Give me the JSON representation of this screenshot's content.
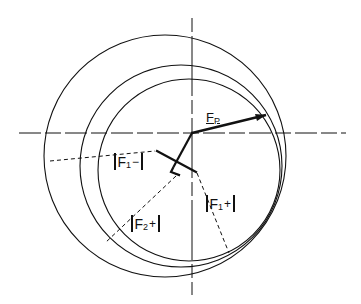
{
  "diagram": {
    "type": "harker-construction",
    "colors": {
      "ink": "#111111",
      "background": "#ffffff"
    },
    "axes": {
      "origin": [
        192,
        133
      ],
      "horizontal": {
        "y": 133,
        "x_from": 19,
        "x_to": 346,
        "style": "dash-dot"
      },
      "vertical": {
        "x": 192,
        "y_from": 18,
        "y_to": 295,
        "style": "dash-dot"
      }
    },
    "circles": [
      {
        "name": "circle-native-F",
        "cx": 189,
        "cy": 170,
        "r": 91
      },
      {
        "name": "circle-derivative-1",
        "cx": 181,
        "cy": 166,
        "r": 101
      },
      {
        "name": "circle-derivative-2",
        "cx": 165,
        "cy": 156,
        "r": 121
      }
    ],
    "vector_fp": {
      "from": [
        192,
        133
      ],
      "to": [
        265,
        115
      ],
      "label": "F",
      "label_sub": "P"
    },
    "labels": [
      {
        "id": "f1-minus",
        "symbol": "F",
        "sub": "1",
        "sign": "−"
      },
      {
        "id": "f2-plus",
        "symbol": "F",
        "sub": "2",
        "sign": "+"
      },
      {
        "id": "f1-plus",
        "symbol": "F",
        "sub": "1",
        "sign": "+"
      }
    ]
  }
}
